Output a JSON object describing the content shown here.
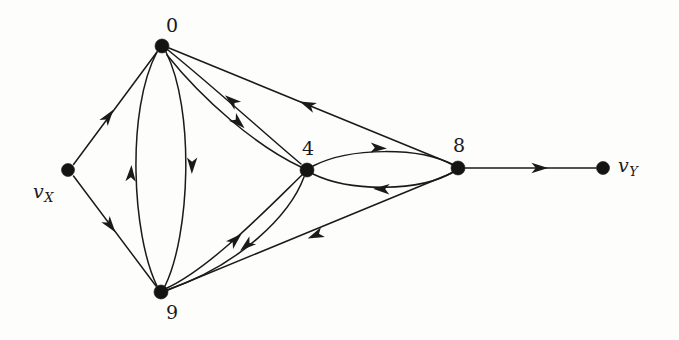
{
  "figure": {
    "kind": "directed-graph",
    "background_color": "#fdfdfb",
    "ink_color": "#1a1a1a",
    "width": 679,
    "height": 340
  },
  "nodes": [
    {
      "id": "vX",
      "label": "v",
      "sublabel": "X",
      "italic": true,
      "x": 68,
      "y": 170,
      "r": 6.5,
      "label_x": 33,
      "label_y": 182
    },
    {
      "id": "n0",
      "label": "0",
      "sublabel": "",
      "italic": false,
      "x": 162,
      "y": 46,
      "r": 7.0,
      "label_x": 166,
      "label_y": 16
    },
    {
      "id": "n9",
      "label": "9",
      "sublabel": "",
      "italic": false,
      "x": 161,
      "y": 292,
      "r": 7.0,
      "label_x": 166,
      "label_y": 303
    },
    {
      "id": "n4",
      "label": "4",
      "sublabel": "",
      "italic": false,
      "x": 307,
      "y": 170,
      "r": 7.0,
      "label_x": 302,
      "label_y": 139
    },
    {
      "id": "n8",
      "label": "8",
      "sublabel": "",
      "italic": false,
      "x": 458,
      "y": 168,
      "r": 7.0,
      "label_x": 453,
      "label_y": 136
    },
    {
      "id": "vY",
      "label": "v",
      "sublabel": "Y",
      "italic": true,
      "x": 603,
      "y": 168,
      "r": 6.5,
      "label_x": 618,
      "label_y": 156
    }
  ],
  "edges": [
    {
      "id": "e1",
      "from": "vX",
      "to": "n0",
      "style": "straight",
      "name": "edge-vx-to-0"
    },
    {
      "id": "e2",
      "from": "vX",
      "to": "n9",
      "style": "straight",
      "name": "edge-vx-to-9"
    },
    {
      "id": "e3",
      "from": "n9",
      "to": "n0",
      "style": "curved-left",
      "name": "edge-9-to-0"
    },
    {
      "id": "e4",
      "from": "n0",
      "to": "n9",
      "style": "curved-right",
      "name": "edge-0-to-9"
    },
    {
      "id": "e5",
      "from": "n4",
      "to": "n0",
      "style": "curved-upper",
      "name": "edge-4-to-0"
    },
    {
      "id": "e6",
      "from": "n0",
      "to": "n4",
      "style": "curved-lower",
      "name": "edge-0-to-4"
    },
    {
      "id": "e7",
      "from": "n9",
      "to": "n4",
      "style": "curved-upper",
      "name": "edge-9-to-4"
    },
    {
      "id": "e8",
      "from": "n4",
      "to": "n9",
      "style": "curved-lower",
      "name": "edge-4-to-9"
    },
    {
      "id": "e9",
      "from": "n4",
      "to": "n8",
      "style": "curved-upper",
      "name": "edge-4-to-8"
    },
    {
      "id": "e10",
      "from": "n8",
      "to": "n4",
      "style": "curved-lower",
      "name": "edge-8-to-4"
    },
    {
      "id": "e11",
      "from": "n8",
      "to": "n0",
      "style": "straight",
      "name": "edge-8-to-0"
    },
    {
      "id": "e12",
      "from": "n8",
      "to": "n9",
      "style": "straight",
      "name": "edge-8-to-9"
    },
    {
      "id": "e13",
      "from": "n8",
      "to": "vY",
      "style": "straight",
      "name": "edge-8-to-vy"
    }
  ],
  "geometry": {
    "paths": [
      {
        "name": "edge-vx-to-0",
        "d": "M 73.5,164.5 L 157,52",
        "arrow": {
          "x": 108,
          "y": 117,
          "angle": -53.4
        }
      },
      {
        "name": "edge-vx-to-9",
        "d": "M 73.5,176 L 156,286",
        "arrow": {
          "x": 110,
          "y": 225,
          "angle": 53.0
        }
      },
      {
        "name": "edge-9-to-0",
        "d": "M 157,286 C 132,235 126,110 157,52",
        "arrow": {
          "x": 131,
          "y": 174,
          "angle": -87.0
        }
      },
      {
        "name": "edge-0-to-9",
        "d": "M 166,52 C 195,110 190,235 165,286",
        "arrow": {
          "x": 192,
          "y": 165,
          "angle": 91.0
        }
      },
      {
        "name": "edge-4-to-0",
        "d": "M 301,164 C 272,140 215,88 168,50",
        "arrow": {
          "x": 232,
          "y": 101,
          "angle": -141.0
        }
      },
      {
        "name": "edge-0-to-4",
        "d": "M 167,55 C 203,100 256,146 301,167",
        "arrow": {
          "x": 238,
          "y": 122,
          "angle": 43.0
        }
      },
      {
        "name": "edge-9-to-4",
        "d": "M 167,288 C 210,268 266,210 302,175",
        "arrow": {
          "x": 235,
          "y": 240,
          "angle": -43.0
        }
      },
      {
        "name": "edge-4-to-9",
        "d": "M 304,177 C 290,215 240,265 167,290",
        "arrow": {
          "x": 247,
          "y": 245,
          "angle": 140.0
        }
      },
      {
        "name": "edge-4-to-8",
        "d": "M 313,166 C 350,147 420,147 453,165",
        "arrow": {
          "x": 378,
          "y": 148,
          "angle": 3.0
        }
      },
      {
        "name": "edge-8-to-4",
        "d": "M 453,172 C 420,192 350,192 313,174",
        "arrow": {
          "x": 382,
          "y": 189,
          "angle": -178.0
        }
      },
      {
        "name": "edge-8-to-0",
        "d": "M 452,164 L 169,48",
        "arrow": {
          "x": 308,
          "y": 105,
          "angle": -157.7
        }
      },
      {
        "name": "edge-8-to-9",
        "d": "M 452,173 L 168,290",
        "arrow": {
          "x": 316,
          "y": 235,
          "angle": 157.6
        }
      },
      {
        "name": "edge-8-to-vy",
        "d": "M 465,168 L 596,168",
        "arrow": {
          "x": 539,
          "y": 168,
          "angle": 0
        }
      }
    ]
  }
}
